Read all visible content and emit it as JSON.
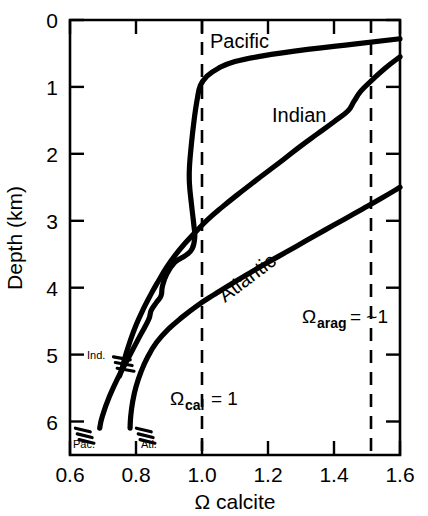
{
  "chart_data": {
    "type": "line",
    "title": "",
    "xlabel": "Ω calcite",
    "ylabel": "Depth (km)",
    "xlim": [
      0.6,
      1.6
    ],
    "ylim": [
      0,
      6.5
    ],
    "y_inverted": true,
    "grid": false,
    "legend": "inline-labels",
    "x_ticks": [
      "0.6",
      "0.8",
      "1.0",
      "1.2",
      "1.4",
      "1.6"
    ],
    "x_tick_values": [
      0.6,
      0.8,
      1.0,
      1.2,
      1.4,
      1.6
    ],
    "y_ticks": [
      "0",
      "1",
      "2",
      "3",
      "4",
      "5",
      "6"
    ],
    "y_tick_values": [
      0,
      1,
      2,
      3,
      4,
      5,
      6
    ],
    "series": [
      {
        "name": "Pacific",
        "label": "Pacific",
        "end_label": "Pac.",
        "points": [
          [
            1.6,
            0.28
          ],
          [
            1.46,
            0.36
          ],
          [
            1.32,
            0.44
          ],
          [
            1.18,
            0.54
          ],
          [
            1.1,
            0.62
          ],
          [
            1.05,
            0.72
          ],
          [
            1.015,
            0.84
          ],
          [
            0.995,
            0.98
          ],
          [
            0.985,
            1.2
          ],
          [
            0.976,
            1.5
          ],
          [
            0.968,
            1.85
          ],
          [
            0.962,
            2.2
          ],
          [
            0.962,
            2.45
          ],
          [
            0.968,
            2.75
          ],
          [
            0.975,
            3.05
          ],
          [
            0.978,
            3.25
          ],
          [
            0.97,
            3.42
          ],
          [
            0.95,
            3.52
          ],
          [
            0.918,
            3.62
          ],
          [
            0.893,
            3.8
          ],
          [
            0.88,
            3.98
          ],
          [
            0.876,
            4.12
          ],
          [
            0.862,
            4.22
          ],
          [
            0.846,
            4.34
          ],
          [
            0.838,
            4.48
          ],
          [
            0.812,
            4.72
          ],
          [
            0.78,
            5.02
          ],
          [
            0.748,
            5.32
          ],
          [
            0.72,
            5.62
          ],
          [
            0.698,
            5.92
          ],
          [
            0.69,
            6.1
          ]
        ]
      },
      {
        "name": "Indian",
        "label": "Indian",
        "end_label": "Ind.",
        "points": [
          [
            1.6,
            0.55
          ],
          [
            1.555,
            0.72
          ],
          [
            1.515,
            0.9
          ],
          [
            1.482,
            1.06
          ],
          [
            1.46,
            1.22
          ],
          [
            1.442,
            1.36
          ],
          [
            1.4,
            1.52
          ],
          [
            1.35,
            1.7
          ],
          [
            1.3,
            1.88
          ],
          [
            1.248,
            2.08
          ],
          [
            1.2,
            2.26
          ],
          [
            1.152,
            2.44
          ],
          [
            1.105,
            2.62
          ],
          [
            1.06,
            2.8
          ],
          [
            1.018,
            2.98
          ],
          [
            0.982,
            3.16
          ],
          [
            0.948,
            3.34
          ],
          [
            0.918,
            3.52
          ],
          [
            0.892,
            3.7
          ],
          [
            0.868,
            3.9
          ],
          [
            0.845,
            4.1
          ],
          [
            0.822,
            4.32
          ],
          [
            0.8,
            4.56
          ],
          [
            0.782,
            4.8
          ],
          [
            0.768,
            5.02
          ],
          [
            0.757,
            5.22
          ],
          [
            0.75,
            5.32
          ]
        ]
      },
      {
        "name": "Atlantic",
        "label": "Atlantic",
        "end_label": "Atl.",
        "points": [
          [
            1.6,
            2.5
          ],
          [
            1.545,
            2.66
          ],
          [
            1.488,
            2.82
          ],
          [
            1.43,
            2.98
          ],
          [
            1.372,
            3.14
          ],
          [
            1.315,
            3.3
          ],
          [
            1.258,
            3.46
          ],
          [
            1.2,
            3.62
          ],
          [
            1.145,
            3.78
          ],
          [
            1.09,
            3.94
          ],
          [
            1.038,
            4.1
          ],
          [
            0.988,
            4.26
          ],
          [
            0.94,
            4.44
          ],
          [
            0.898,
            4.62
          ],
          [
            0.862,
            4.82
          ],
          [
            0.835,
            5.04
          ],
          [
            0.815,
            5.26
          ],
          [
            0.8,
            5.48
          ],
          [
            0.79,
            5.7
          ],
          [
            0.784,
            5.92
          ],
          [
            0.782,
            6.1
          ]
        ]
      }
    ],
    "reference_lines": [
      {
        "name": "calcite-saturation-horizon",
        "x": 1.0,
        "style": "dashed",
        "label": "Ω",
        "label_sub": "cal",
        "label_tail": "= 1"
      },
      {
        "name": "aragonite-saturation-horizon",
        "x": 1.5,
        "style": "dashed",
        "label": "Ω",
        "label_sub": "arag",
        "label_tail": "= ~1"
      }
    ],
    "annotations": [
      {
        "name": "pacific-label",
        "text": "Pacific",
        "x": 1.07,
        "y": 0.22,
        "rotation": 0
      },
      {
        "name": "indian-label",
        "text": "Indian",
        "x": 1.27,
        "y": 1.42,
        "rotation": 0
      },
      {
        "name": "atlantic-label",
        "text": "Atlantic",
        "x": 1.17,
        "y": 4.18,
        "rotation": -37
      },
      {
        "name": "pacific-endpoint-label",
        "text": "Pac.",
        "x": 0.635,
        "y": 6.33
      },
      {
        "name": "atlantic-endpoint-label",
        "text": "Atl.",
        "x": 0.795,
        "y": 6.33
      },
      {
        "name": "indian-endpoint-label",
        "text": "Ind.",
        "x": 0.648,
        "y": 5.3
      }
    ]
  }
}
